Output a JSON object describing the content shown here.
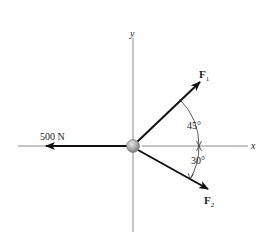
{
  "diagram": {
    "axes": {
      "x_label": "x",
      "y_label": "y",
      "color": "#8a8a8a"
    },
    "forces": [
      {
        "name": "500 N",
        "label": "500 N",
        "direction": "negative x",
        "angle_deg": 180
      },
      {
        "name": "F1",
        "label_main": "F",
        "label_sub": "1",
        "angle_from_x_deg": 45,
        "side": "above x-axis"
      },
      {
        "name": "F2",
        "label_main": "F",
        "label_sub": "2",
        "angle_from_x_deg": 30,
        "side": "below x-axis"
      }
    ],
    "angles": [
      {
        "label": "45°",
        "between": "F1 and x-axis"
      },
      {
        "label": "30°",
        "between": "x-axis and F2"
      }
    ],
    "particle": {
      "color": "#a9a9a9"
    },
    "arrow_color": "#111111"
  }
}
